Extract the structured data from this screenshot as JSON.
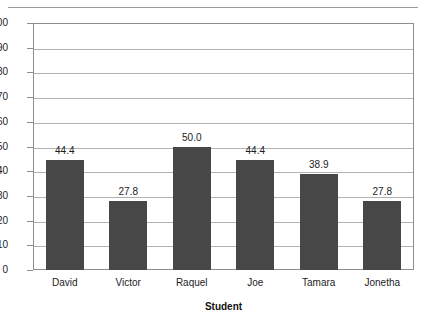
{
  "chart_data": {
    "type": "bar",
    "title": "",
    "xlabel": "Student",
    "ylabel": "",
    "categories": [
      "David",
      "Victor",
      "Raquel",
      "Joe",
      "Tamara",
      "Jonetha"
    ],
    "values": [
      44.4,
      27.8,
      50.0,
      44.4,
      38.9,
      27.8
    ],
    "data_labels": [
      "44.4",
      "27.8",
      "50.0",
      "44.4",
      "38.9",
      "27.8"
    ],
    "ylim": [
      0,
      100
    ],
    "ytick_step": 10,
    "ytick_labels": [
      "100",
      "90",
      "80",
      "70",
      "60",
      "50",
      "40",
      "30",
      "20",
      "10",
      "0"
    ],
    "grid": true,
    "legend": false,
    "bar_color": "#474747",
    "gridline_color": "#b2b2b2",
    "axis_color": "#8d8d8d"
  }
}
